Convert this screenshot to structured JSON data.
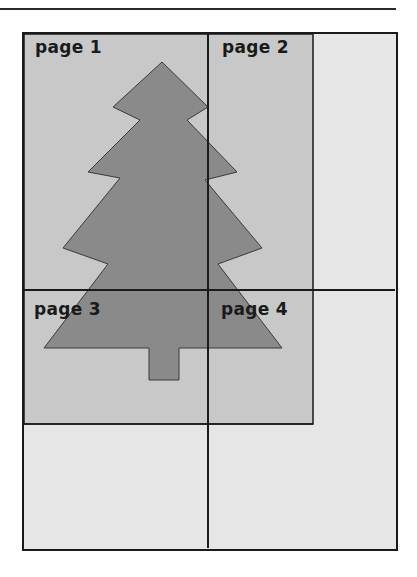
{
  "diagram": {
    "pages": [
      {
        "label": "page 1"
      },
      {
        "label": "page 2"
      },
      {
        "label": "page 3"
      },
      {
        "label": "page 4"
      }
    ],
    "shapes": {
      "image": "christmas-tree",
      "image_region": "printable-area"
    },
    "colors": {
      "background": "#ffffff",
      "frame_fill": "#e6e6e6",
      "image_region_fill": "#c8c8c8",
      "tree_fill": "#8a8a8a",
      "lines": "#1a1a1a"
    }
  }
}
